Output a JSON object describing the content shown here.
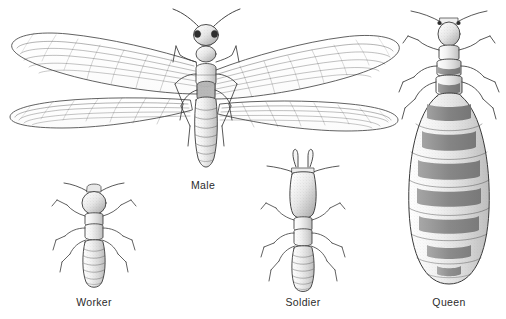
{
  "plate": {
    "title": "Termite castes",
    "background_color": "#ffffff",
    "ink_color": "#3a3a3a",
    "label_color": "#2b2b2b",
    "medium": "pen-and-ink stipple line drawing",
    "figure_count": 4
  },
  "labels": {
    "male": "Male",
    "worker": "Worker",
    "soldier": "Soldier",
    "queen": "Queen"
  },
  "figures": [
    {
      "id": "male",
      "label": "Male",
      "caste": "alate / reproductive male",
      "wings": 4,
      "legs": 6,
      "antennae": 2,
      "abdomen_segments": 7,
      "features": "long narrow membranous wings with fine parallel venation, compound eyes, elongated segmented abdomen",
      "label_position": "below"
    },
    {
      "id": "worker",
      "label": "Worker",
      "caste": "worker",
      "wings": 0,
      "legs": 6,
      "antennae": 2,
      "abdomen_segments": 8,
      "features": "rounded stippled head, no wings, pale segmented abdomen",
      "label_position": "below"
    },
    {
      "id": "soldier",
      "label": "Soldier",
      "caste": "soldier",
      "wings": 0,
      "legs": 6,
      "antennae": 2,
      "abdomen_segments": 8,
      "mandibles": 2,
      "features": "greatly enlarged elongate head with prominent curved mandibles",
      "label_position": "below"
    },
    {
      "id": "queen",
      "label": "Queen",
      "caste": "queen (physogastric)",
      "wings": 0,
      "legs": 6,
      "antennae": 2,
      "abdomen_segments": 9,
      "abdomen_bands": 8,
      "features": "small head and thorax with hugely swollen egg-filled abdomen bearing dark transverse tergite bands",
      "label_position": "below"
    }
  ]
}
